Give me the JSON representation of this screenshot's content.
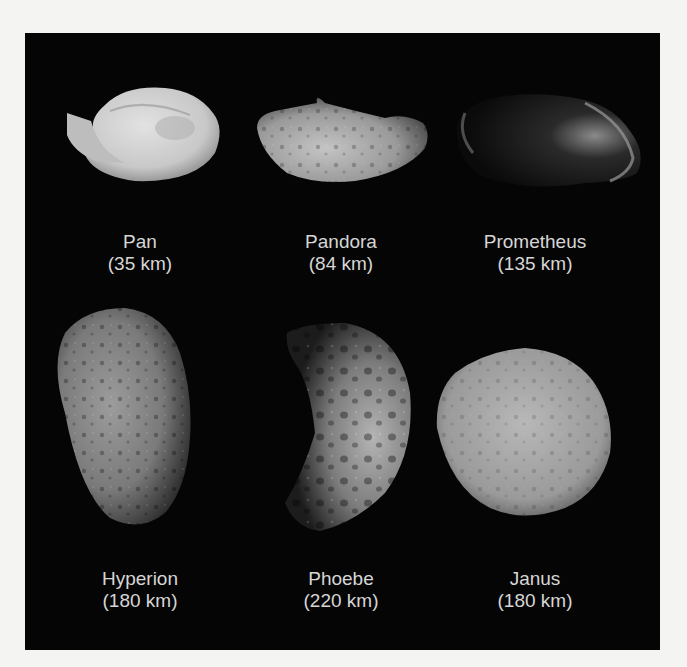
{
  "figure": {
    "moons": [
      {
        "name": "Pan",
        "diameter": "(35 km)"
      },
      {
        "name": "Pandora",
        "diameter": "(84 km)"
      },
      {
        "name": "Prometheus",
        "diameter": "(135 km)"
      },
      {
        "name": "Hyperion",
        "diameter": "(180 km)"
      },
      {
        "name": "Phoebe",
        "diameter": "(220 km)"
      },
      {
        "name": "Janus",
        "diameter": "(180 km)"
      }
    ]
  }
}
